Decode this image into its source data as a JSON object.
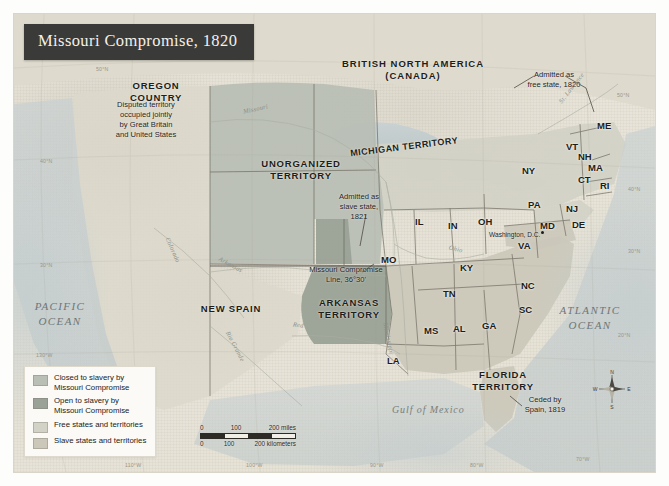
{
  "title": "Missouri Compromise, 1820",
  "colors": {
    "closed_to_slavery": "#b9bfb5",
    "open_to_slavery": "#9aa196",
    "free_states": "#d3d2c6",
    "slave_states": "#cbc8ba",
    "banner_bg": "#3a3a38",
    "banner_text": "#f4f1ea",
    "ocean": "#c4cdce",
    "paper": "#e5e1d5"
  },
  "legend": {
    "items": [
      {
        "label": "Closed to slavery by\nMissouri Compromise",
        "color": "#b9bfb5"
      },
      {
        "label": "Open to slavery by\nMissouri Compromise",
        "color": "#9aa196"
      },
      {
        "label": "Free states and territories",
        "color": "#d3d2c6"
      },
      {
        "label": "Slave states and territories",
        "color": "#cbc8ba"
      }
    ]
  },
  "scale": {
    "miles": {
      "ticks": [
        "0",
        "100",
        "200 miles"
      ]
    },
    "kilometers": {
      "ticks": [
        "0",
        "100",
        "200 kilometers"
      ]
    }
  },
  "compass": {
    "north": "N",
    "east": "E",
    "south": "S",
    "west": "W"
  },
  "regions": [
    {
      "name": "oregon-country",
      "label": "OREGON\nCOUNTRY",
      "x": 120,
      "y": 80
    },
    {
      "name": "british-north-america",
      "label": "BRITISH NORTH AMERICA\n(CANADA)",
      "x": 345,
      "y": 58
    },
    {
      "name": "unorganized-territory",
      "label": "UNORGANIZED\nTERRITORY",
      "x": 257,
      "y": 158
    },
    {
      "name": "michigan-territory",
      "label": "MICHIGAN TERRITORY",
      "x": 370,
      "y": 142
    },
    {
      "name": "new-spain",
      "label": "NEW SPAIN",
      "x": 196,
      "y": 303
    },
    {
      "name": "arkansas-territory",
      "label": "ARKANSAS\nTERRITORY",
      "x": 330,
      "y": 297
    },
    {
      "name": "florida-territory",
      "label": "FLORIDA\nTERRITORY",
      "x": 478,
      "y": 369
    }
  ],
  "annotations": [
    {
      "name": "oregon-note",
      "text": "Disputed territory\noccupied jointly\nby Great Britain\nand United States",
      "x": 103,
      "y": 100
    },
    {
      "name": "maine-note",
      "text": "Admitted as\nfree state, 1820",
      "x": 519,
      "y": 70
    },
    {
      "name": "missouri-note",
      "text": "Admitted as\nslave state,\n1821",
      "x": 333,
      "y": 192
    },
    {
      "name": "compromise-line-note",
      "text": "Missouri Compromise\nLine, 36°30'",
      "x": 303,
      "y": 265
    },
    {
      "name": "florida-note",
      "text": "Ceded by\nSpain, 1819",
      "x": 519,
      "y": 395
    }
  ],
  "oceans": [
    {
      "name": "pacific-ocean",
      "label": "PACIFIC\nOCEAN",
      "x": 28,
      "y": 299
    },
    {
      "name": "atlantic-ocean",
      "label": "ATLANTIC\nOCEAN",
      "x": 558,
      "y": 303
    },
    {
      "name": "gulf-of-mexico",
      "label": "Gulf of Mexico",
      "x": 396,
      "y": 404
    }
  ],
  "states": [
    {
      "abbr": "ME",
      "x": 597,
      "y": 120
    },
    {
      "abbr": "VT",
      "x": 566,
      "y": 141
    },
    {
      "abbr": "NH",
      "x": 578,
      "y": 151
    },
    {
      "abbr": "NY",
      "x": 522,
      "y": 165
    },
    {
      "abbr": "MA",
      "x": 588,
      "y": 162
    },
    {
      "abbr": "CT",
      "x": 578,
      "y": 174
    },
    {
      "abbr": "RI",
      "x": 600,
      "y": 180
    },
    {
      "abbr": "PA",
      "x": 528,
      "y": 199
    },
    {
      "abbr": "NJ",
      "x": 566,
      "y": 203
    },
    {
      "abbr": "MD",
      "x": 540,
      "y": 220
    },
    {
      "abbr": "DE",
      "x": 572,
      "y": 219
    },
    {
      "abbr": "VA",
      "x": 518,
      "y": 240
    },
    {
      "abbr": "OH",
      "x": 478,
      "y": 216
    },
    {
      "abbr": "IN",
      "x": 448,
      "y": 220
    },
    {
      "abbr": "IL",
      "x": 415,
      "y": 216
    },
    {
      "abbr": "KY",
      "x": 460,
      "y": 262
    },
    {
      "abbr": "TN",
      "x": 443,
      "y": 288
    },
    {
      "abbr": "NC",
      "x": 521,
      "y": 280
    },
    {
      "abbr": "SC",
      "x": 519,
      "y": 304
    },
    {
      "abbr": "GA",
      "x": 482,
      "y": 320
    },
    {
      "abbr": "AL",
      "x": 453,
      "y": 323
    },
    {
      "abbr": "MS",
      "x": 424,
      "y": 325
    },
    {
      "abbr": "LA",
      "x": 387,
      "y": 355
    },
    {
      "abbr": "MO",
      "x": 381,
      "y": 254
    }
  ],
  "capital": {
    "label": "Washington, D.C.",
    "x": 492,
    "y": 231
  },
  "rivers": [
    {
      "label": "Missouri",
      "x": 243,
      "y": 105,
      "rot": -12
    },
    {
      "label": "Mississippi",
      "x": 389,
      "y": 322,
      "rot": 78
    },
    {
      "label": "Ohio",
      "x": 449,
      "y": 245,
      "rot": 14
    },
    {
      "label": "Colorado",
      "x": 171,
      "y": 236,
      "rot": 66
    },
    {
      "label": "Arkansas",
      "x": 221,
      "y": 255,
      "rot": 28
    },
    {
      "label": "Rio Grande",
      "x": 231,
      "y": 330,
      "rot": 62
    },
    {
      "label": "Red",
      "x": 293,
      "y": 321,
      "rot": 8
    },
    {
      "label": "St. Lawrence",
      "x": 557,
      "y": 100,
      "rot": 52
    }
  ],
  "graticule_labels": [
    {
      "text": "130°W",
      "x": 36,
      "y": 352
    },
    {
      "text": "120°W",
      "x": 44,
      "y": 444
    },
    {
      "text": "110°W",
      "x": 125,
      "y": 462
    },
    {
      "text": "100°W",
      "x": 246,
      "y": 462
    },
    {
      "text": "90°W",
      "x": 370,
      "y": 462
    },
    {
      "text": "80°W",
      "x": 470,
      "y": 462
    },
    {
      "text": "70°W",
      "x": 576,
      "y": 456
    },
    {
      "text": "50°N",
      "x": 96,
      "y": 66
    },
    {
      "text": "40°N",
      "x": 40,
      "y": 158
    },
    {
      "text": "30°N",
      "x": 40,
      "y": 262
    },
    {
      "text": "50°N",
      "x": 617,
      "y": 92
    },
    {
      "text": "40°N",
      "x": 628,
      "y": 186
    },
    {
      "text": "30°N",
      "x": 628,
      "y": 248
    },
    {
      "text": "20°N",
      "x": 618,
      "y": 332
    }
  ]
}
